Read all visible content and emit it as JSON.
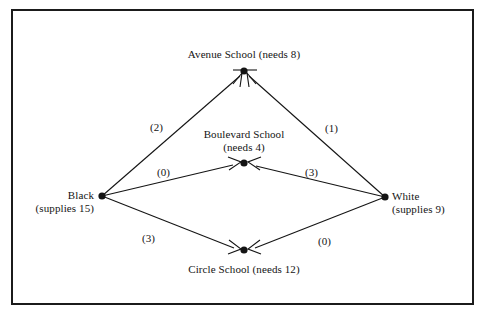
{
  "figure": {
    "kind": "network-flow-diagram",
    "border_color": "#1b1b1b",
    "ink_color": "#141414",
    "background": "#ffffff"
  },
  "nodes": [
    {
      "id": "avenue",
      "role": "demand",
      "line1": "Avenue School (needs 8)",
      "line2": "",
      "need": 8,
      "x": 244,
      "y": 71
    },
    {
      "id": "boulevard",
      "role": "demand",
      "line1": "Boulevard School",
      "line2": "(needs 4)",
      "need": 4,
      "x": 244,
      "y": 163
    },
    {
      "id": "circle",
      "role": "demand",
      "line1": "Circle School (needs 12)",
      "line2": "",
      "need": 12,
      "x": 244,
      "y": 250
    },
    {
      "id": "black",
      "role": "supply",
      "line1": "Black",
      "line2": "(supplies 15)",
      "supply": 15,
      "x": 102,
      "y": 196
    },
    {
      "id": "white",
      "role": "supply",
      "line1": "White",
      "line2": "(supplies 9)",
      "supply": 9,
      "x": 385,
      "y": 197
    }
  ],
  "edges": [
    {
      "id": "black-avenue",
      "from": "black",
      "to": "avenue",
      "label": "(2)",
      "cost": 2,
      "label_x": 150,
      "label_y": 121
    },
    {
      "id": "white-avenue",
      "from": "white",
      "to": "avenue",
      "label": "(1)",
      "cost": 1,
      "label_x": 325,
      "label_y": 122
    },
    {
      "id": "black-boulevard",
      "from": "black",
      "to": "boulevard",
      "label": "(0)",
      "cost": 0,
      "label_x": 157,
      "label_y": 166
    },
    {
      "id": "white-boulevard",
      "from": "white",
      "to": "boulevard",
      "label": "(3)",
      "cost": 3,
      "label_x": 305,
      "label_y": 166
    },
    {
      "id": "black-circle",
      "from": "black",
      "to": "circle",
      "label": "(3)",
      "cost": 3,
      "label_x": 142,
      "label_y": 232
    },
    {
      "id": "white-circle",
      "from": "white",
      "to": "circle",
      "label": "(0)",
      "cost": 0,
      "label_x": 318,
      "label_y": 235
    }
  ]
}
